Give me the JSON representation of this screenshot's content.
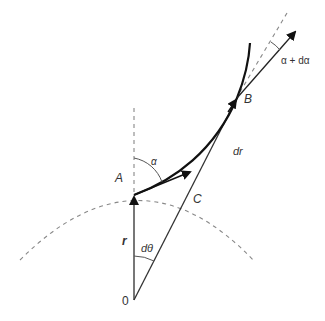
{
  "diagram": {
    "colors": {
      "curve": "#111111",
      "line": "#333333",
      "dashed": "#888888",
      "label": "#333333"
    },
    "labels": {
      "origin": "0",
      "point_a": "A",
      "point_b": "B",
      "point_c": "C",
      "radius": "r",
      "dr": "dr",
      "dtheta": "dθ",
      "alpha": "α",
      "alpha_plus": "α + dα"
    },
    "points": {
      "origin": [
        134,
        300
      ],
      "A": [
        134,
        195
      ],
      "B": [
        237,
        98
      ],
      "C": [
        187,
        198
      ]
    }
  }
}
